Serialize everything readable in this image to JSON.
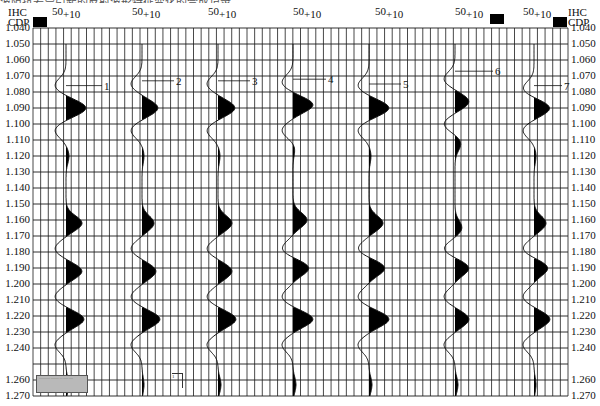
{
  "caption_fragment": "波阻抗差异引起的反射波形特征变化的合成记录",
  "axes": {
    "left_header": {
      "line1": "IHC",
      "line2": "CDP"
    },
    "right_header": {
      "line1": "IHC",
      "line2": "CDP"
    },
    "y_tick_labels": [
      "1.040",
      "1.050",
      "1.060",
      "1.070",
      "1.080",
      "1.090",
      "1.100",
      "1.110",
      "1.120",
      "1.130",
      "1.140",
      "1.150",
      "1.160",
      "1.170",
      "1.180",
      "1.190",
      "1.200",
      "1.210",
      "1.220",
      "1.230",
      "1.240",
      "1.260",
      "1.270"
    ]
  },
  "trace_header": {
    "ref": "50",
    "offset": "+10"
  },
  "traces": [
    {
      "label": "1"
    },
    {
      "label": "2"
    },
    {
      "label": "3"
    },
    {
      "label": "4"
    },
    {
      "label": "5"
    },
    {
      "label": "6"
    },
    {
      "label": "7"
    }
  ],
  "legend_box": {
    "text": "··········· ········ ··· ····· ····"
  },
  "marker_box": {
    "text": "1"
  },
  "colors": {
    "grid": "#1a1a1a",
    "fill": "#000000",
    "legend_bg": "#b9b9b9"
  },
  "chart_data": {
    "type": "line",
    "subtype": "seismic-wiggle-variable-area",
    "title": "",
    "xlabel": "CDP",
    "ylabel": "Time (s)",
    "ylim": [
      1.04,
      1.27
    ],
    "y_ticks": [
      1.04,
      1.05,
      1.06,
      1.07,
      1.08,
      1.09,
      1.1,
      1.11,
      1.12,
      1.13,
      1.14,
      1.15,
      1.16,
      1.17,
      1.18,
      1.19,
      1.2,
      1.21,
      1.22,
      1.23,
      1.24,
      1.26,
      1.27
    ],
    "grid": true,
    "series": [
      {
        "name": "1",
        "label_time": 1.076,
        "peaks": [
          {
            "t": 1.09,
            "amp": 1.0
          },
          {
            "t": 1.12,
            "amp": 0.15
          },
          {
            "t": 1.162,
            "amp": 0.8
          },
          {
            "t": 1.192,
            "amp": 0.8
          },
          {
            "t": 1.222,
            "amp": 0.9
          },
          {
            "t": 1.263,
            "amp": 0.15
          }
        ],
        "troughs": [
          1.076,
          1.104,
          1.178,
          1.208,
          1.238
        ]
      },
      {
        "name": "2",
        "label_time": 1.073,
        "peaks": [
          {
            "t": 1.09,
            "amp": 0.8
          },
          {
            "t": 1.12,
            "amp": 0.1
          },
          {
            "t": 1.162,
            "amp": 0.6
          },
          {
            "t": 1.192,
            "amp": 0.7
          },
          {
            "t": 1.222,
            "amp": 0.9
          },
          {
            "t": 1.263,
            "amp": 0.1
          }
        ],
        "troughs": [
          1.075,
          1.104,
          1.178,
          1.208,
          1.238
        ]
      },
      {
        "name": "3",
        "label_time": 1.073,
        "peaks": [
          {
            "t": 1.09,
            "amp": 0.85
          },
          {
            "t": 1.12,
            "amp": 0.1
          },
          {
            "t": 1.162,
            "amp": 0.7
          },
          {
            "t": 1.192,
            "amp": 0.7
          },
          {
            "t": 1.222,
            "amp": 0.9
          },
          {
            "t": 1.263,
            "amp": 0.15
          }
        ],
        "troughs": [
          1.075,
          1.104,
          1.178,
          1.208,
          1.238
        ]
      },
      {
        "name": "4",
        "label_time": 1.072,
        "peaks": [
          {
            "t": 1.088,
            "amp": 1.0
          },
          {
            "t": 1.115,
            "amp": 0.1
          },
          {
            "t": 1.16,
            "amp": 0.7
          },
          {
            "t": 1.19,
            "amp": 0.8
          },
          {
            "t": 1.222,
            "amp": 1.0
          },
          {
            "t": 1.263,
            "amp": 0.15
          }
        ],
        "troughs": [
          1.074,
          1.104,
          1.178,
          1.208,
          1.238
        ]
      },
      {
        "name": "5",
        "label_time": 1.075,
        "peaks": [
          {
            "t": 1.09,
            "amp": 1.0
          },
          {
            "t": 1.12,
            "amp": 0.1
          },
          {
            "t": 1.162,
            "amp": 0.7
          },
          {
            "t": 1.19,
            "amp": 0.8
          },
          {
            "t": 1.222,
            "amp": 1.0
          },
          {
            "t": 1.263,
            "amp": 0.15
          }
        ],
        "troughs": [
          1.076,
          1.104,
          1.178,
          1.208,
          1.238
        ]
      },
      {
        "name": "6",
        "label_time": 1.067,
        "peaks": [
          {
            "t": 1.086,
            "amp": 0.7
          },
          {
            "t": 1.112,
            "amp": 0.3
          },
          {
            "t": 1.165,
            "amp": 0.35
          },
          {
            "t": 1.19,
            "amp": 0.7
          },
          {
            "t": 1.222,
            "amp": 0.7
          },
          {
            "t": 1.263,
            "amp": 0.15
          }
        ],
        "troughs": [
          1.072,
          1.1,
          1.178,
          1.208,
          1.238
        ]
      },
      {
        "name": "7",
        "label_time": 1.076,
        "peaks": [
          {
            "t": 1.09,
            "amp": 0.8
          },
          {
            "t": 1.12,
            "amp": 0.1
          },
          {
            "t": 1.162,
            "amp": 0.6
          },
          {
            "t": 1.19,
            "amp": 0.7
          },
          {
            "t": 1.222,
            "amp": 0.8
          },
          {
            "t": 1.263,
            "amp": 0.1
          }
        ],
        "troughs": [
          1.078,
          1.104,
          1.178,
          1.208,
          1.238
        ]
      }
    ],
    "legend": "none",
    "annotations": [
      "50",
      "+10",
      "IHC",
      "CDP"
    ]
  }
}
